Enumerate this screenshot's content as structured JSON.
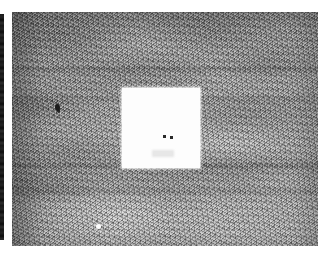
{
  "figure": {
    "kind": "grayscale-micrograph",
    "description": "Grainy grayscale photograph of a rough, mottled textured surface with horizontal streak banding",
    "canvas": {
      "width": 318,
      "height": 256,
      "background_color": "#ffffff"
    },
    "plate": {
      "name": "micrograph-plate",
      "x": 12,
      "y": 12,
      "width": 306,
      "height": 234,
      "mean_tone_color": "#9d9d9d",
      "dark_tone_color": "#3c3c3c",
      "light_tone_color": "#e8e8e8",
      "tonal_note": "upper half darker and more strongly mottled; lower third lighter with horizontal streaks"
    },
    "adjacent_panel_sliver": {
      "name": "adjacent-panel-sliver",
      "x": 0,
      "y": 14,
      "width": 4,
      "height": 226,
      "color": "#1d1d1d",
      "note": "clipped dark edge of the neighbouring figure panel"
    },
    "white_patch": {
      "name": "white-patch",
      "x": 110,
      "y": 76,
      "width": 78,
      "height": 80,
      "color": "#fdfdfd",
      "note": "blank white square masking the centre of the micrograph"
    },
    "markers": [
      {
        "name": "patch-marker-left",
        "x": 151,
        "y": 123,
        "size": 3,
        "color": "#2a2a2a"
      },
      {
        "name": "patch-marker-right",
        "x": 158,
        "y": 124,
        "size": 3,
        "color": "#2a2a2a"
      }
    ],
    "defects": [
      {
        "name": "dark-speck",
        "x": 55,
        "y": 104,
        "color": "#1c1c1c",
        "tone": "dark"
      },
      {
        "name": "bright-speck",
        "x": 96,
        "y": 224,
        "color": "#fdfdfd",
        "tone": "light"
      }
    ],
    "labels": {
      "caption": "",
      "scale_bar": "",
      "panel_letter": ""
    }
  }
}
